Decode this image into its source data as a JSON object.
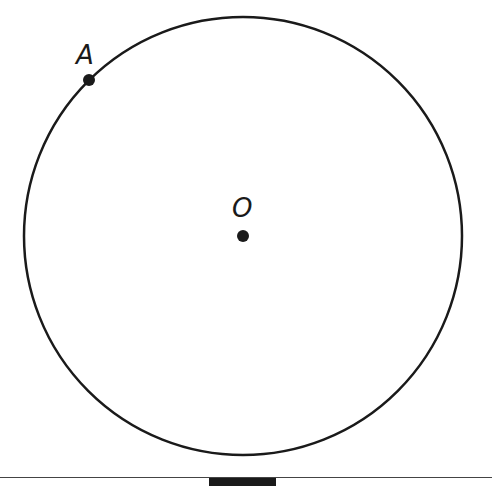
{
  "diagram": {
    "type": "circle-with-points",
    "circle": {
      "center": {
        "x": 243,
        "y": 236
      },
      "radius": 219,
      "stroke": "#1a1a1a",
      "stroke_width": 2.5
    },
    "points": [
      {
        "id": "A",
        "label": "A",
        "x": 89,
        "y": 80,
        "on_circle": true,
        "label_pos": {
          "x": 76,
          "y": 42
        }
      },
      {
        "id": "O",
        "label": "O",
        "x": 243,
        "y": 236,
        "is_center": true,
        "label_pos": {
          "x": 232,
          "y": 195
        }
      }
    ],
    "point_color": "#1a1a1a",
    "point_radius": 6
  },
  "labels": {
    "point_a": "A",
    "center_o": "O"
  }
}
